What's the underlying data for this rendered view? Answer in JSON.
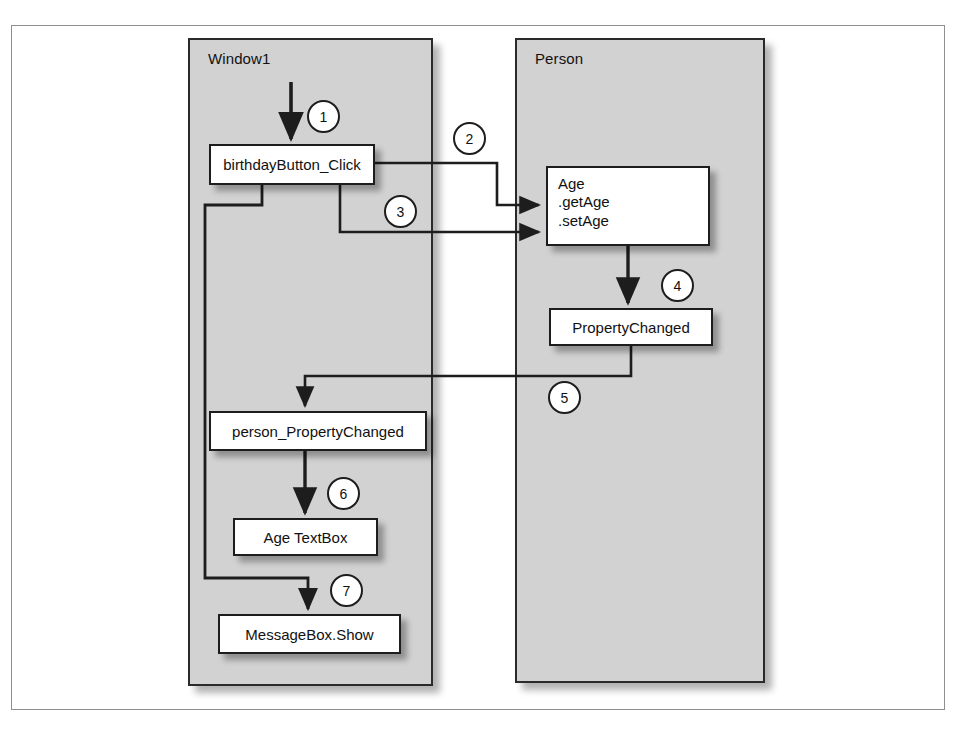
{
  "figure": {
    "type": "sequence-flow-diagram"
  },
  "containers": [
    {
      "id": "window1",
      "title": "Window1",
      "x": 188,
      "y": 38,
      "w": 245,
      "h": 648
    },
    {
      "id": "person",
      "title": "Person",
      "x": 515,
      "y": 38,
      "w": 250,
      "h": 645
    }
  ],
  "nodes": [
    {
      "id": "birthday-button-click",
      "label": "birthdayButton_Click",
      "lines": [
        "birthdayButton_Click"
      ],
      "x": 209,
      "y": 144,
      "w": 166,
      "h": 41,
      "container": "window1"
    },
    {
      "id": "age-property",
      "label": "Age .getAge .setAge",
      "lines": [
        "Age",
        ".getAge",
        ".setAge"
      ],
      "x": 546,
      "y": 166,
      "w": 164,
      "h": 80,
      "container": "person"
    },
    {
      "id": "property-changed",
      "label": "PropertyChanged",
      "lines": [
        "PropertyChanged"
      ],
      "x": 549,
      "y": 308,
      "w": 164,
      "h": 38,
      "container": "person"
    },
    {
      "id": "person-property-changed",
      "label": "person_PropertyChanged",
      "lines": [
        "person_PropertyChanged"
      ],
      "x": 209,
      "y": 411,
      "w": 218,
      "h": 40,
      "container": "window1"
    },
    {
      "id": "age-textbox",
      "label": "Age TextBox",
      "lines": [
        "Age TextBox"
      ],
      "x": 233,
      "y": 518,
      "w": 145,
      "h": 38,
      "container": "window1"
    },
    {
      "id": "messagebox-show",
      "label": "MessageBox.Show",
      "lines": [
        "MessageBox.Show"
      ],
      "x": 218,
      "y": 614,
      "w": 183,
      "h": 40,
      "container": "window1"
    }
  ],
  "steps": [
    {
      "number": "1",
      "cx": 323,
      "cy": 116,
      "from": "user-action",
      "to": "birthday-button-click"
    },
    {
      "number": "2",
      "cx": 469,
      "cy": 138,
      "from": "birthday-button-click",
      "to": "age-property.getAge"
    },
    {
      "number": "3",
      "cx": 400,
      "cy": 211,
      "from": "birthday-button-click",
      "to": "age-property.setAge"
    },
    {
      "number": "4",
      "cx": 677,
      "cy": 285,
      "from": "age-property",
      "to": "property-changed"
    },
    {
      "number": "5",
      "cx": 564,
      "cy": 397,
      "from": "property-changed",
      "to": "person-property-changed"
    },
    {
      "number": "6",
      "cx": 343,
      "cy": 493,
      "from": "person-property-changed",
      "to": "age-textbox"
    },
    {
      "number": "7",
      "cx": 346,
      "cy": 590,
      "from": "birthday-button-click",
      "to": "messagebox-show"
    }
  ],
  "colors": {
    "container_fill": "#d2d2d2",
    "node_fill": "#ffffff",
    "stroke": "#1d1d1d",
    "page_background": "#ffffff",
    "frame_border": "#8e8e8e"
  }
}
